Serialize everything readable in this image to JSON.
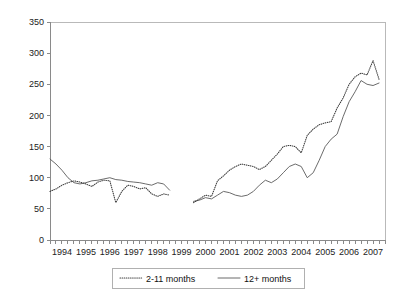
{
  "chart_data": {
    "type": "line",
    "title": "",
    "xlabel": "",
    "ylabel": "",
    "ylim": [
      0,
      350
    ],
    "yticks": [
      0,
      50,
      100,
      150,
      200,
      250,
      300,
      350
    ],
    "xticks": [
      "1994",
      "1995",
      "1996",
      "1997",
      "1998",
      "1999",
      "2000",
      "2001",
      "2002",
      "2003",
      "2004",
      "2005",
      "2006",
      "2007"
    ],
    "grid": false,
    "legend_position": "bottom",
    "x_start_year": 1994,
    "x_end_year": 2008,
    "x_period": "quarterly",
    "note": "data gap between 1999 and 2000",
    "series": [
      {
        "name": "2-11 months",
        "style": "dotted",
        "color": "#3f3f3f",
        "x": [
          1994.0,
          1994.25,
          1994.5,
          1994.75,
          1995.0,
          1995.25,
          1995.5,
          1995.75,
          1996.0,
          1996.25,
          1996.5,
          1996.75,
          1997.0,
          1997.25,
          1997.5,
          1997.75,
          1998.0,
          1998.25,
          1998.5,
          1998.75,
          1999.0,
          2000.0,
          2000.25,
          2000.5,
          2000.75,
          2001.0,
          2001.25,
          2001.5,
          2001.75,
          2002.0,
          2002.25,
          2002.5,
          2002.75,
          2003.0,
          2003.25,
          2003.5,
          2003.75,
          2004.0,
          2004.25,
          2004.5,
          2004.75,
          2005.0,
          2005.25,
          2005.5,
          2005.75,
          2006.0,
          2006.25,
          2006.5,
          2006.75,
          2007.0,
          2007.25,
          2007.5,
          2007.75
        ],
        "values": [
          78,
          82,
          88,
          92,
          95,
          93,
          90,
          86,
          93,
          96,
          95,
          60,
          78,
          88,
          86,
          82,
          84,
          74,
          70,
          74,
          72,
          60,
          66,
          72,
          70,
          95,
          103,
          112,
          118,
          122,
          120,
          118,
          113,
          118,
          128,
          138,
          150,
          152,
          150,
          140,
          168,
          178,
          185,
          188,
          190,
          212,
          228,
          250,
          262,
          268,
          265,
          288,
          258
        ]
      },
      {
        "name": "12+ months",
        "style": "solid",
        "color": "#5a5a5a",
        "x": [
          1994.0,
          1994.25,
          1994.5,
          1994.75,
          1995.0,
          1995.25,
          1995.5,
          1995.75,
          1996.0,
          1996.25,
          1996.5,
          1996.75,
          1997.0,
          1997.25,
          1997.5,
          1997.75,
          1998.0,
          1998.25,
          1998.5,
          1998.75,
          1999.0,
          2000.0,
          2000.25,
          2000.5,
          2000.75,
          2001.0,
          2001.25,
          2001.5,
          2001.75,
          2002.0,
          2002.25,
          2002.5,
          2002.75,
          2003.0,
          2003.25,
          2003.5,
          2003.75,
          2004.0,
          2004.25,
          2004.5,
          2004.75,
          2005.0,
          2005.25,
          2005.5,
          2005.75,
          2006.0,
          2006.25,
          2006.5,
          2006.75,
          2007.0,
          2007.25,
          2007.5,
          2007.75
        ],
        "values": [
          130,
          122,
          112,
          100,
          92,
          90,
          92,
          95,
          96,
          98,
          100,
          97,
          96,
          94,
          93,
          92,
          90,
          88,
          92,
          90,
          80,
          62,
          64,
          68,
          66,
          72,
          78,
          76,
          72,
          70,
          72,
          78,
          88,
          96,
          92,
          98,
          108,
          118,
          122,
          118,
          100,
          108,
          128,
          150,
          162,
          170,
          198,
          222,
          238,
          256,
          250,
          248,
          252
        ]
      }
    ]
  },
  "legend": {
    "items": [
      {
        "label": "2-11 months"
      },
      {
        "label": "12+ months"
      }
    ]
  },
  "axes": {
    "y_labels": [
      "350",
      "300",
      "250",
      "200",
      "150",
      "100",
      "50",
      "0"
    ],
    "x_labels": [
      "1994",
      "1995",
      "1996",
      "1997",
      "1998",
      "1999",
      "2000",
      "2001",
      "2002",
      "2003",
      "2004",
      "2005",
      "2006",
      "2007"
    ]
  }
}
